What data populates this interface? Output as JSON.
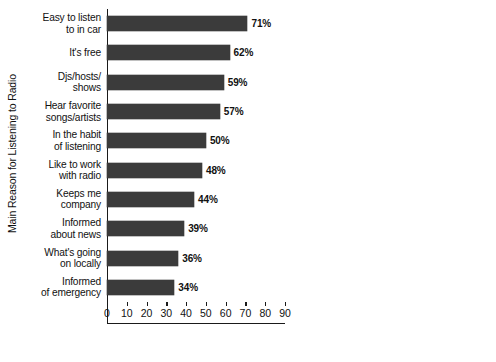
{
  "chart_data": [
    {
      "id": "left",
      "type": "bar",
      "orientation": "horizontal",
      "title": "",
      "xlabel": "",
      "ylabel": "Main Reason for Listening to Radio",
      "xlim": [
        0,
        90
      ],
      "xticks": [
        0,
        10,
        20,
        30,
        40,
        50,
        60,
        70,
        80,
        90
      ],
      "grid": false,
      "legend": "none",
      "value_suffix": "%",
      "bar_color": "#3b3b3b",
      "categories": [
        "Easy to listen to in car",
        "It's free",
        "Djs/hosts/ shows",
        "Hear favorite songs/artists",
        "In the habit of listening",
        "Like to work with radio",
        "Keeps me company",
        "Informed about news",
        "What's going on locally",
        "Informed of emergency"
      ],
      "category_lines": [
        [
          "Easy to listen",
          "to in car"
        ],
        [
          "It's free"
        ],
        [
          "Djs/hosts/",
          "shows"
        ],
        [
          "Hear favorite",
          "songs/artists"
        ],
        [
          "In the habit",
          "of listening"
        ],
        [
          "Like to work",
          "with radio"
        ],
        [
          "Keeps me",
          "company"
        ],
        [
          "Informed",
          "about news"
        ],
        [
          "What's going",
          "on locally"
        ],
        [
          "Informed",
          "of emergency"
        ]
      ],
      "values": [
        71,
        62,
        59,
        57,
        50,
        48,
        44,
        39,
        36,
        34
      ],
      "value_labels": [
        "71%",
        "62%",
        "59%",
        "57%",
        "50%",
        "48%",
        "44%",
        "39%",
        "36%",
        "34%"
      ]
    },
    {
      "id": "right",
      "type": "bar",
      "orientation": "horizontal",
      "title": "",
      "xlabel": "",
      "ylabel": "",
      "xlim": [
        0,
        50
      ],
      "xticks": [
        0,
        10,
        20,
        30,
        40,
        50
      ],
      "grid": false,
      "legend": "none",
      "value_suffix": "%",
      "bar_color": "#3b3b3b",
      "categories": [
        "Get in better mood",
        "Enjoy talk shows",
        "Weather",
        "Escape daily life pressures",
        "Discover new music/artists",
        "Traffic",
        "Music surprises",
        "Music curation",
        "Charitable/ community events",
        "Sports",
        "Win prizes"
      ],
      "category_lines": [
        [
          "Get in better",
          "mood"
        ],
        [
          "Enjoy talk",
          "shows"
        ],
        [
          "Weather"
        ],
        [
          "Escape daily",
          "life pressures"
        ],
        [
          "Discover new",
          "music/artists"
        ],
        [
          "Traffic"
        ],
        [
          "Music",
          "surprises"
        ],
        [
          "Music",
          "curation"
        ],
        [
          "Charitable/",
          "community",
          "events"
        ],
        [
          "Sports"
        ],
        [
          "Win prizes"
        ]
      ],
      "values": [
        34,
        32,
        28,
        28,
        27,
        27,
        23,
        21,
        20,
        17,
        14
      ],
      "value_labels": [
        "34%",
        "32%",
        "28%",
        "28%",
        "27%",
        "27%",
        "23%",
        "21%",
        "20%",
        "17%",
        "14%"
      ]
    }
  ]
}
